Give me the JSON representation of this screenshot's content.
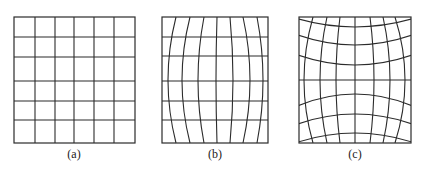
{
  "figure": {
    "line_color": "#2b2b2b",
    "background": "#ffffff",
    "panels": [
      {
        "id": "a",
        "label": "(a)",
        "description": "undistorted square grid",
        "frame": {
          "x": 14,
          "y": 17,
          "w": 121,
          "h": 126
        },
        "label_pos": {
          "x": 74,
          "y": 158
        },
        "vertical_x": [
          35,
          55,
          74,
          94,
          114
        ],
        "horizontal_y": [
          37,
          57,
          81,
          101,
          120
        ],
        "vertical_bulge": 0,
        "horizontal_sag": [
          0,
          0,
          0,
          0,
          0
        ]
      },
      {
        "id": "b",
        "label": "(b)",
        "description": "grid with curved vertical lines (barrel distortion horizontally), straight horizontal lines",
        "frame": {
          "x": 162,
          "y": 17,
          "w": 106,
          "h": 126
        },
        "label_pos": {
          "x": 215,
          "y": 158
        },
        "vertical_top_x": [
          176,
          190,
          204,
          217,
          230,
          243,
          257
        ],
        "vertical_mid_x": [
          168,
          182,
          198,
          216,
          233,
          250,
          263
        ],
        "horizontal_y": [
          37,
          56,
          81,
          101,
          120
        ]
      },
      {
        "id": "c",
        "label": "(c)",
        "description": "grid with both vertical and horizontal lines curved (barrel distortion)",
        "frame": {
          "x": 299,
          "y": 17,
          "w": 112,
          "h": 126
        },
        "label_pos": {
          "x": 355,
          "y": 158
        },
        "vertical_top_x": [
          313,
          327,
          340,
          355,
          370,
          383,
          395
        ],
        "vertical_mid_x": [
          304,
          320,
          336,
          355,
          374,
          390,
          405
        ],
        "horizontal_curves": [
          {
            "edge_y": 18,
            "center_y": 27
          },
          {
            "edge_y": 34,
            "center_y": 45
          },
          {
            "edge_y": 54,
            "center_y": 65
          },
          {
            "edge_y": 80,
            "center_y": 80
          },
          {
            "edge_y": 107,
            "center_y": 94
          },
          {
            "edge_y": 125,
            "center_y": 114
          },
          {
            "edge_y": 143,
            "center_y": 133
          }
        ]
      }
    ]
  }
}
